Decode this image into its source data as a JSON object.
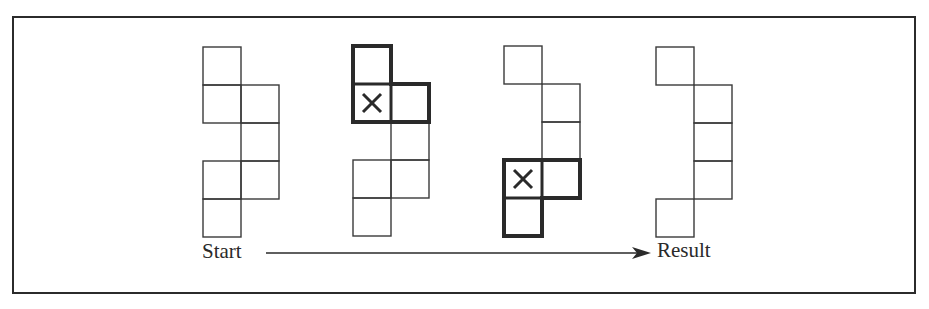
{
  "diagram": {
    "cell_size": 38,
    "stroke_color": "#3a3a3a",
    "bold_color": "#2a2a2a",
    "figures": [
      {
        "name": "start",
        "origin": [
          203,
          47
        ],
        "cells": [
          [
            0,
            0
          ],
          [
            0,
            1
          ],
          [
            1,
            1
          ],
          [
            1,
            2
          ],
          [
            0,
            3
          ],
          [
            1,
            3
          ],
          [
            0,
            4
          ]
        ],
        "bold_group": [],
        "x_mark": null
      },
      {
        "name": "step-1",
        "origin": [
          353,
          46
        ],
        "cells": [
          [
            0,
            0
          ],
          [
            0,
            1
          ],
          [
            1,
            1
          ],
          [
            1,
            2
          ],
          [
            0,
            3
          ],
          [
            1,
            3
          ],
          [
            0,
            4
          ]
        ],
        "bold_group": [
          [
            0,
            0
          ],
          [
            0,
            1
          ],
          [
            1,
            1
          ]
        ],
        "x_mark": [
          0,
          1
        ]
      },
      {
        "name": "step-2",
        "origin": [
          504,
          46
        ],
        "cells": [
          [
            0,
            0
          ],
          [
            1,
            1
          ],
          [
            1,
            2
          ],
          [
            0,
            3
          ],
          [
            1,
            3
          ],
          [
            0,
            4
          ]
        ],
        "bold_group": [
          [
            0,
            3
          ],
          [
            1,
            3
          ],
          [
            0,
            4
          ]
        ],
        "x_mark": [
          0,
          3
        ]
      },
      {
        "name": "result",
        "origin": [
          656,
          47
        ],
        "cells": [
          [
            0,
            0
          ],
          [
            1,
            1
          ],
          [
            1,
            2
          ],
          [
            1,
            3
          ],
          [
            0,
            4
          ]
        ],
        "bold_group": [],
        "x_mark": null
      }
    ],
    "arrow": {
      "x1": 266,
      "x2": 651,
      "y": 253
    },
    "labels": {
      "start": "Start",
      "result": "Result"
    }
  }
}
